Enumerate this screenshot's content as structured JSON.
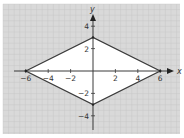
{
  "diagram": {
    "type": "coordinate-plane",
    "shape": "rhombus",
    "axes": {
      "x_label": "x",
      "y_label": "y",
      "x_ticks": [
        {
          "value": -6,
          "label": "−6"
        },
        {
          "value": -4,
          "label": "−4"
        },
        {
          "value": -2,
          "label": "−2"
        },
        {
          "value": 2,
          "label": "2"
        },
        {
          "value": 4,
          "label": "4"
        },
        {
          "value": 6,
          "label": "6"
        }
      ],
      "y_ticks": [
        {
          "value": 4,
          "label": "4"
        },
        {
          "value": 2,
          "label": "2"
        },
        {
          "value": -2,
          "label": "−2"
        },
        {
          "value": -4,
          "label": "−4"
        }
      ],
      "xlim": [
        -7,
        7.5
      ],
      "ylim": [
        -5.5,
        5.5
      ],
      "grid": true
    },
    "vertices": [
      {
        "x": -6,
        "y": 0
      },
      {
        "x": 0,
        "y": 3
      },
      {
        "x": 6,
        "y": 0
      },
      {
        "x": 0,
        "y": -3
      }
    ],
    "colors": {
      "background": "#d9d9d9",
      "grid": "#c4c4c4",
      "shape_fill": "#ffffff",
      "stroke": "#3a3a3a",
      "text": "#333333"
    }
  }
}
